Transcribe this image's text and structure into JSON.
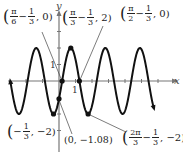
{
  "chart_data": {
    "type": "line",
    "title": "",
    "function": "y = -2cos(3x + 1)",
    "xlabel": "x",
    "ylabel": "y",
    "xlim": [
      -3.5,
      7.4
    ],
    "ylim": [
      -2.6,
      4.9
    ],
    "ticks": {
      "x": [
        "1"
      ],
      "y": [
        "1"
      ]
    },
    "grid": false,
    "series": [
      {
        "name": "curve",
        "period": "2π/3",
        "amplitude": 2
      }
    ],
    "points": [
      {
        "label": "(π/6 − 1/3, 0)",
        "x": 0.19,
        "y": 0
      },
      {
        "label": "(π/3 − 1/3, 2)",
        "x": 0.714,
        "y": 2
      },
      {
        "label": "(π/2 − 1/3, 0)",
        "x": 1.237,
        "y": 0
      },
      {
        "label": "(−1/3, −2)",
        "x": -0.333,
        "y": -2
      },
      {
        "label": "(0, −1.08)",
        "x": 0,
        "y": -1.08
      },
      {
        "label": "(2π/3 − 1/3, −2)",
        "x": 1.761,
        "y": -2
      }
    ]
  },
  "labels": {
    "axis_x": "x",
    "axis_y": "y",
    "tick_x1": "1",
    "tick_y1": "1",
    "p1": {
      "a_n": "π",
      "a_d": "6",
      "b_n": "1",
      "b_d": "3",
      "tail": ", 0)"
    },
    "p2": {
      "a_n": "π",
      "a_d": "3",
      "b_n": "1",
      "b_d": "3",
      "tail": ", 2)"
    },
    "p3": {
      "a_n": "π",
      "a_d": "2",
      "b_n": "1",
      "b_d": "3",
      "tail": ", 0)"
    },
    "p4": {
      "b_n": "1",
      "b_d": "3",
      "tail": ", −2)"
    },
    "p5": "(0, −1.08)",
    "p6": {
      "a_n": "2π",
      "a_d": "3",
      "b_n": "1",
      "b_d": "3",
      "tail": ", −2)"
    }
  }
}
